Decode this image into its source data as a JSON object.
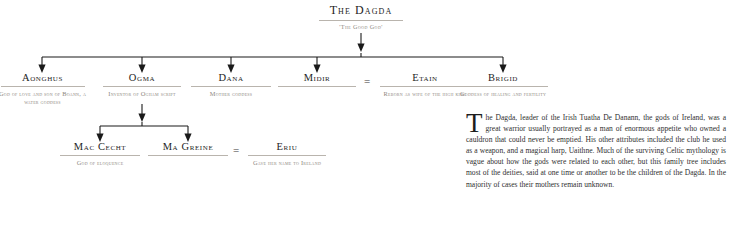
{
  "diagram": {
    "root": {
      "name": "The Dagda",
      "desc": "'The Good God'"
    },
    "generation_1": [
      {
        "name": "Aonghus",
        "desc": "God of love and son of Boann, a water goddess"
      },
      {
        "name": "Ogma",
        "desc": "Inventor of Ogham script"
      },
      {
        "name": "Dana",
        "desc": "Mother goddess"
      },
      {
        "name": "Midir",
        "desc": ""
      },
      {
        "name": "Etain",
        "desc": "Reborn as wife of the high king"
      },
      {
        "name": "Brigid",
        "desc": "Goddess of healing and fertility"
      }
    ],
    "generation_2": [
      {
        "name": "Mac Cecht",
        "desc": "God of eloquence"
      },
      {
        "name": "Ma Greine",
        "desc": ""
      },
      {
        "name": "Eriu",
        "desc": "Gave her name to Ireland"
      }
    ],
    "marriage_symbol": "=",
    "marriage_symbol_2": "="
  },
  "article": {
    "dropcap": "T",
    "body": "he Dagda, leader of the Irish Tuatha De Danann, the gods of Ireland, was a great warrior usually portrayed as a man of enormous appetite who owned a cauldron that could never be emptied. His other attributes included the club he used as a weapon, and a magical harp, Uaithne. Much of the surviving Celtic mythology is vague about how the gods were related to each other, but this family tree includes most of the deities, said at one time or another to be the children of the Dagda. In the majority of cases their mothers remain unknown."
  },
  "colors": {
    "ink": "#2b2b2b",
    "name_ink": "#1d1d1d",
    "desc_ink": "#8d8880",
    "rule": "#b9b4ad",
    "wire": "#1a1a1a",
    "background": "#ffffff"
  }
}
